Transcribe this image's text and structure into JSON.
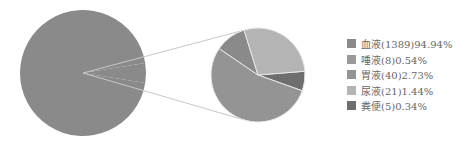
{
  "chart_data": {
    "type": "pie",
    "subtype": "pie-of-pie",
    "title": "",
    "legend_position": "right",
    "categories": [
      "血液",
      "唾液",
      "胃液",
      "尿液",
      "粪便"
    ],
    "counts": [
      1389,
      8,
      40,
      21,
      5
    ],
    "values": [
      94.94,
      0.54,
      2.73,
      1.44,
      0.34
    ],
    "labels": [
      "血液(1389)94.94%",
      "唾液(8)0.54%",
      "胃液(40)2.73%",
      "尿液(21)1.44%",
      "粪便(5)0.34%"
    ],
    "colors": [
      "#8a8a8a",
      "#9a9a9a",
      "#949494",
      "#b4b4b4",
      "#6e6e6e"
    ],
    "primary_pie": [
      "血液",
      "other"
    ],
    "secondary_pie": [
      "唾液",
      "胃液",
      "尿液",
      "粪便"
    ]
  },
  "legend": {
    "items": [
      {
        "label": "血液(1389)94.94%",
        "color": "#8a8a8a"
      },
      {
        "label": "唾液(8)0.54%",
        "color": "#9a9a9a"
      },
      {
        "label": "胃液(40)2.73%",
        "color": "#949494"
      },
      {
        "label": "尿液(21)1.44%",
        "color": "#b4b4b4"
      },
      {
        "label": "粪便(5)0.34%",
        "color": "#6e6e6e"
      }
    ]
  }
}
